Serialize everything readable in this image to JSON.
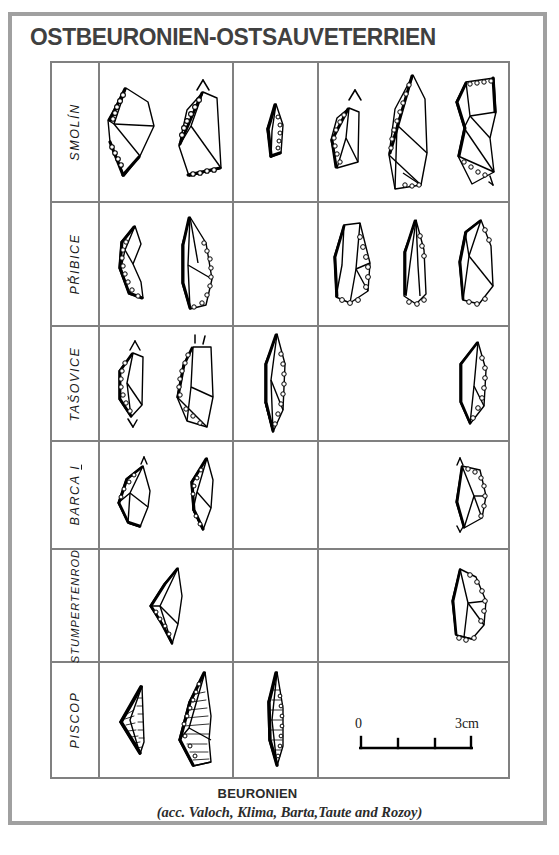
{
  "plate": {
    "title": "OSTBEURONIEN-OSTSAUVETERRIEN",
    "border_color": "#a0a0a0",
    "grid_line_color": "#808080",
    "ink_color": "#000000"
  },
  "table": {
    "columns": [
      {
        "id": "site-label",
        "label": ""
      },
      {
        "id": "column-1",
        "label": ""
      },
      {
        "id": "column-2",
        "label": ""
      },
      {
        "id": "column-3",
        "label": ""
      }
    ],
    "rows": [
      {
        "site": "SMOLÍN",
        "underline": "",
        "counts": {
          "column_1": 2,
          "column_2": 1,
          "column_3": 3
        }
      },
      {
        "site": "PŘIBICE",
        "underline": "",
        "counts": {
          "column_1": 2,
          "column_2": 0,
          "column_3": 3
        }
      },
      {
        "site": "TAŠOVICE",
        "underline": "",
        "counts": {
          "column_1": 2,
          "column_2": 1,
          "column_3": 1
        }
      },
      {
        "site": "BARCA ",
        "underline": "I",
        "counts": {
          "column_1": 2,
          "column_2": 0,
          "column_3": 1
        }
      },
      {
        "site": "STUMPERTENROD",
        "underline": "",
        "counts": {
          "column_1": 1,
          "column_2": 0,
          "column_3": 1
        }
      },
      {
        "site": "PISCOP",
        "underline": "",
        "counts": {
          "column_1": 2,
          "column_2": 1,
          "column_3": 0
        }
      }
    ]
  },
  "scale": {
    "zero_label": "0",
    "max_label": "3cm",
    "intervals": 3,
    "unit": "cm"
  },
  "caption": {
    "main": "BEURONIEN",
    "sub": "(acc. Valoch, Klima, Barta,Taute and Rozoy)"
  }
}
